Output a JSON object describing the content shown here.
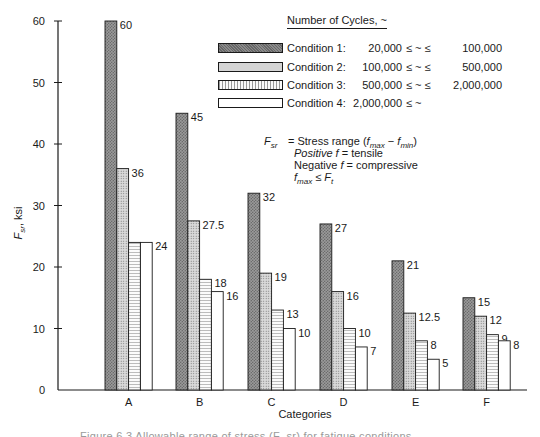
{
  "chart_data": {
    "type": "bar",
    "title": "",
    "xlabel": "Categories",
    "ylabel": "F_sr, ksi",
    "ylim": [
      0,
      60
    ],
    "yticks": [
      0,
      10,
      20,
      30,
      40,
      50,
      60
    ],
    "grid": false,
    "legend_position": "top-right",
    "categories": [
      "A",
      "B",
      "C",
      "D",
      "E",
      "F"
    ],
    "series": [
      {
        "name": "Condition 1",
        "pattern": "dark-crosshatch",
        "values": [
          60,
          45,
          32,
          27,
          21,
          15
        ]
      },
      {
        "name": "Condition 2",
        "pattern": "light-dots",
        "values": [
          36,
          27.5,
          19,
          16,
          12.5,
          12
        ]
      },
      {
        "name": "Condition 3",
        "pattern": "fine-lines",
        "values": [
          24,
          18,
          13,
          10,
          8,
          9
        ]
      },
      {
        "name": "Condition 4",
        "pattern": "white",
        "values": [
          24,
          16,
          10,
          7,
          5,
          8
        ]
      }
    ],
    "value_labels": [
      [
        "60",
        "36",
        "",
        "24"
      ],
      [
        "45",
        "27.5",
        "18",
        "16"
      ],
      [
        "32",
        "19",
        "13",
        "10"
      ],
      [
        "27",
        "16",
        "10",
        "7"
      ],
      [
        "21",
        "12.5",
        "8",
        "5"
      ],
      [
        "15",
        "12",
        "9",
        "8"
      ]
    ]
  },
  "legend": {
    "title": "Number of Cycles, ~",
    "rows": [
      {
        "condition": "Condition  1:",
        "low": "20,000",
        "op": "≤ ~ ≤",
        "high": "100,000"
      },
      {
        "condition": "Condition  2:",
        "low": "100,000",
        "op": "≤ ~ ≤",
        "high": "500,000"
      },
      {
        "condition": "Condition  3:",
        "low": "500,000",
        "op": "≤ ~ ≤",
        "high": "2,000,000"
      },
      {
        "condition": "Condition  4:",
        "low": "2,000,000",
        "op": "≤ ~",
        "high": ""
      }
    ]
  },
  "note": {
    "symbol": "F",
    "symbol_sub": "sr",
    "line1_prefix": "= Stress range (",
    "line1_f1": "f",
    "line1_sub1": "max",
    "line1_minus": " − ",
    "line1_f2": "f",
    "line1_sub2": "min",
    "line1_suffix": ")",
    "line2_word": "Positive",
    "line2_f": " f",
    "line2_rest": " =  tensile",
    "line3_word": "Negative",
    "line3_f": " f",
    "line3_rest": " =  compressive",
    "line4_f": "f",
    "line4_sub": "max",
    "line4_op": " ≤ ",
    "line4_F": "F",
    "line4_sub2": "t"
  },
  "axes": {
    "y_title_main": "F",
    "y_title_sub": "sr",
    "y_title_unit": ", ksi",
    "x_title": "Categories"
  },
  "caption": "Figure 6.3    Allowable range of stress (F_sr) for fatigue conditions ..."
}
